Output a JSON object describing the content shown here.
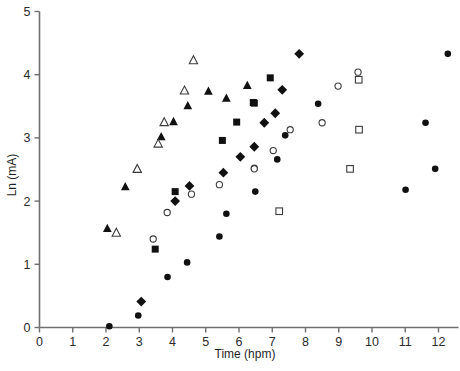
{
  "chart_data": {
    "type": "scatter",
    "title": "",
    "xlabel": "Time (hpm)",
    "ylabel": "Ln (mA)",
    "xlim": [
      0,
      12.6
    ],
    "ylim": [
      0,
      5
    ],
    "xticks": [
      0,
      1,
      2,
      3,
      4,
      5,
      6,
      7,
      8,
      9,
      10,
      11,
      12
    ],
    "yticks": [
      0,
      1,
      2,
      3,
      4,
      5
    ],
    "xtick_labels": [
      "0",
      "1",
      "2",
      "3",
      "4",
      "5",
      "6",
      "7",
      "8",
      "9",
      "10",
      "11",
      "12"
    ],
    "ytick_labels": [
      "0",
      "1",
      "2",
      "3",
      "4",
      "5"
    ],
    "grid": false,
    "legend": "none",
    "series": [
      {
        "name": "filled-triangle",
        "marker": "triangle",
        "fill": "solid",
        "color": "#111111",
        "points": [
          [
            2.04,
            1.57
          ],
          [
            2.58,
            2.23
          ],
          [
            2.94,
            2.51
          ],
          [
            3.66,
            3.02
          ],
          [
            4.03,
            3.26
          ],
          [
            4.46,
            3.51
          ],
          [
            5.08,
            3.74
          ],
          [
            5.62,
            3.63
          ],
          [
            6.25,
            3.83
          ]
        ]
      },
      {
        "name": "open-triangle",
        "marker": "triangle",
        "fill": "open",
        "color": "#3c3c3c",
        "points": [
          [
            2.31,
            1.5
          ],
          [
            2.94,
            2.51
          ],
          [
            3.57,
            2.91
          ],
          [
            3.75,
            3.25
          ],
          [
            4.36,
            3.75
          ],
          [
            4.63,
            4.23
          ]
        ]
      },
      {
        "name": "filled-square",
        "marker": "square",
        "fill": "solid",
        "color": "#111111",
        "points": [
          [
            3.48,
            1.24
          ],
          [
            4.08,
            2.15
          ],
          [
            5.5,
            2.96
          ],
          [
            5.93,
            3.25
          ],
          [
            6.46,
            3.55
          ],
          [
            6.94,
            3.95
          ],
          [
            6.43,
            3.56
          ]
        ]
      },
      {
        "name": "open-square",
        "marker": "square",
        "fill": "open",
        "color": "#3c3c3c",
        "points": [
          [
            7.21,
            1.84
          ],
          [
            9.34,
            2.51
          ],
          [
            9.61,
            3.13
          ],
          [
            9.6,
            3.92
          ]
        ]
      },
      {
        "name": "filled-diamond",
        "marker": "diamond",
        "fill": "solid",
        "color": "#111111",
        "points": [
          [
            3.06,
            0.41
          ],
          [
            4.08,
            2.0
          ],
          [
            4.51,
            2.24
          ],
          [
            5.53,
            2.45
          ],
          [
            6.04,
            2.7
          ],
          [
            6.46,
            2.86
          ],
          [
            6.76,
            3.24
          ],
          [
            7.09,
            3.39
          ],
          [
            7.3,
            3.76
          ],
          [
            7.81,
            4.33
          ]
        ]
      },
      {
        "name": "open-circle",
        "marker": "circle",
        "fill": "open",
        "color": "#3c3c3c",
        "points": [
          [
            3.42,
            1.4
          ],
          [
            3.84,
            1.82
          ],
          [
            4.57,
            2.11
          ],
          [
            5.41,
            2.26
          ],
          [
            6.46,
            2.52
          ],
          [
            7.03,
            2.8
          ],
          [
            7.54,
            3.13
          ],
          [
            8.5,
            3.24
          ],
          [
            8.98,
            3.82
          ],
          [
            9.58,
            4.04
          ],
          [
            6.46,
            2.51
          ]
        ]
      },
      {
        "name": "filled-circle",
        "marker": "circle",
        "fill": "solid",
        "color": "#111111",
        "points": [
          [
            2.1,
            0.02
          ],
          [
            2.97,
            0.19
          ],
          [
            3.85,
            0.8
          ],
          [
            4.44,
            1.03
          ],
          [
            5.41,
            1.44
          ],
          [
            5.62,
            1.8
          ],
          [
            6.49,
            2.15
          ],
          [
            7.15,
            2.66
          ],
          [
            7.39,
            3.04
          ],
          [
            8.38,
            3.54
          ],
          [
            11.01,
            2.18
          ],
          [
            11.9,
            2.51
          ],
          [
            11.61,
            3.24
          ],
          [
            12.28,
            4.33
          ]
        ]
      }
    ]
  }
}
